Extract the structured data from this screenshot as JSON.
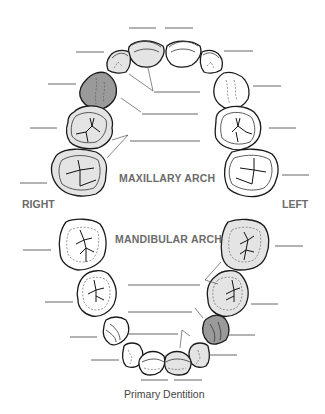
{
  "labels": {
    "maxillary_arch": "MAXILLARY ARCH",
    "mandibular_arch": "MANDIBULAR ARCH",
    "right": "RIGHT",
    "left": "LEFT",
    "caption": "Primary Dentition"
  },
  "colors": {
    "shaded_light": "#e4e4e4",
    "shaded_dark": "#9a9a9a",
    "unshaded": "#ffffff",
    "outline": "#1a1a1a",
    "label_gray": "#6b6b6b"
  },
  "maxillary_arch": {
    "right_side": [
      {
        "tooth": "central-incisor",
        "shading": "light"
      },
      {
        "tooth": "lateral-incisor",
        "shading": "light"
      },
      {
        "tooth": "canine",
        "shading": "dark"
      },
      {
        "tooth": "first-molar",
        "shading": "light"
      },
      {
        "tooth": "second-molar",
        "shading": "light"
      }
    ],
    "left_side": [
      {
        "tooth": "central-incisor",
        "shading": "none"
      },
      {
        "tooth": "lateral-incisor",
        "shading": "none"
      },
      {
        "tooth": "canine",
        "shading": "none"
      },
      {
        "tooth": "first-molar",
        "shading": "none"
      },
      {
        "tooth": "second-molar",
        "shading": "none"
      }
    ],
    "answer_blanks": 13
  },
  "mandibular_arch": {
    "right_side": [
      {
        "tooth": "second-molar",
        "shading": "none"
      },
      {
        "tooth": "first-molar",
        "shading": "none"
      },
      {
        "tooth": "canine",
        "shading": "none"
      },
      {
        "tooth": "lateral-incisor",
        "shading": "none"
      },
      {
        "tooth": "central-incisor",
        "shading": "none"
      }
    ],
    "left_side": [
      {
        "tooth": "second-molar",
        "shading": "light"
      },
      {
        "tooth": "first-molar",
        "shading": "light"
      },
      {
        "tooth": "canine",
        "shading": "dark"
      },
      {
        "tooth": "lateral-incisor",
        "shading": "light"
      },
      {
        "tooth": "central-incisor",
        "shading": "light"
      }
    ],
    "answer_blanks": 13
  }
}
